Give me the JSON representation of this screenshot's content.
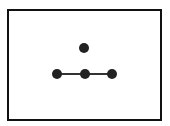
{
  "diagram": {
    "type": "graph",
    "frame": {
      "x": 7,
      "y": 9,
      "width": 153,
      "height": 110,
      "stroke": "#111111"
    },
    "node_color": "#222222",
    "edge_color": "#333333",
    "nodes": [
      {
        "id": "top",
        "cx": 84,
        "cy": 48,
        "r": 5
      },
      {
        "id": "left",
        "cx": 57,
        "cy": 74,
        "r": 5
      },
      {
        "id": "center",
        "cx": 85,
        "cy": 74,
        "r": 5
      },
      {
        "id": "right",
        "cx": 112,
        "cy": 74,
        "r": 5
      }
    ],
    "edges": [
      {
        "from": "left",
        "to": "center"
      },
      {
        "from": "center",
        "to": "right"
      }
    ]
  }
}
